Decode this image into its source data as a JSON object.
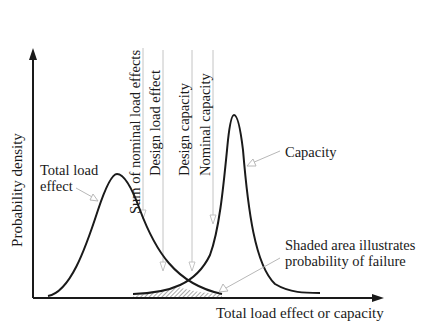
{
  "diagram": {
    "y_axis_label": "Probability density",
    "x_axis_label": "Total load effect or capacity",
    "curves": {
      "load": {
        "label_line1": "Total load",
        "label_line2": "effect"
      },
      "capacity": {
        "label": "Capacity"
      }
    },
    "vertical_markers": [
      {
        "label": "Sum of nominal load effects"
      },
      {
        "label": "Design load effect"
      },
      {
        "label": "Design capacity"
      },
      {
        "label": "Nominal capacity"
      }
    ],
    "failure_note": {
      "line1": "Shaded area illustrates",
      "line2": "probability of failure"
    },
    "colors": {
      "curve": "#1a1a1a",
      "axis": "#1a1a1a",
      "leader": "#b8b8b8",
      "marker_line": "#c4c4c4"
    }
  }
}
